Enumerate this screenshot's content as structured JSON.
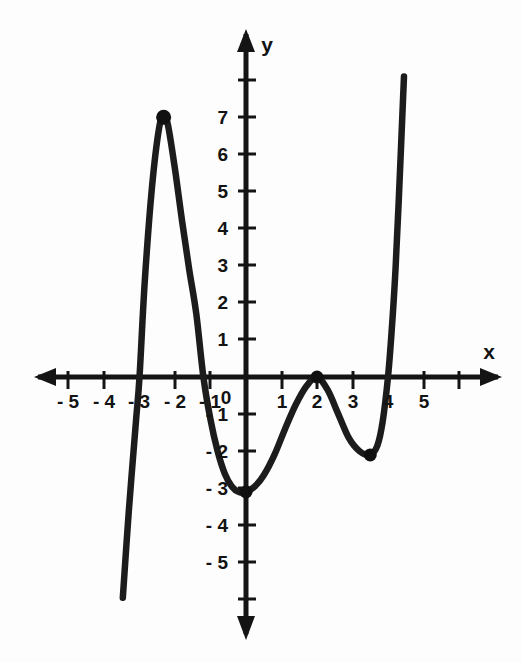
{
  "figure": {
    "title": "",
    "background_color": "#fdfdfd",
    "ink_color": "#141414"
  },
  "axes": {
    "x_axis_label": "x",
    "y_axis_label": "y",
    "origin_label": "0",
    "x_tick_labels": [
      "- 5",
      "- 4",
      "- 3",
      "- 2",
      "- 1",
      "1",
      "2",
      "3",
      "4",
      "5",
      "6"
    ],
    "y_tick_labels": [
      "7",
      "6",
      "5",
      "4",
      "3",
      "2",
      "1",
      "- 1",
      "- 2",
      "- 3",
      "- 4",
      "- 5"
    ]
  },
  "chart_data": {
    "type": "line",
    "title": "",
    "xlabel": "x",
    "ylabel": "y",
    "grid": false,
    "legend": null,
    "xlim": [
      -5.7,
      7.2
    ],
    "ylim": [
      -7.0,
      9.4
    ],
    "xticks": [
      -5,
      -4,
      -3,
      -2,
      -1,
      0,
      1,
      2,
      3,
      4,
      5,
      6
    ],
    "yticks": [
      -6,
      -5,
      -4,
      -3,
      -2,
      -1,
      0,
      1,
      2,
      3,
      4,
      5,
      6,
      7,
      8
    ],
    "xtick_labels_shown": [
      -5,
      -4,
      -3,
      -2,
      -1,
      1,
      2,
      3,
      4,
      5
    ],
    "ytick_labels_shown": [
      7,
      6,
      5,
      4,
      3,
      2,
      1,
      -1,
      -2,
      -3,
      -4,
      -5
    ],
    "series": [
      {
        "name": "polynomial curve",
        "x": [
          -3.47,
          -3.3,
          -3.1,
          -3.0,
          -2.85,
          -2.65,
          -2.45,
          -2.32,
          -2.2,
          -2.0,
          -1.8,
          -1.6,
          -1.4,
          -1.2,
          -1.0,
          -0.8,
          -0.6,
          -0.4,
          -0.2,
          0.0,
          0.25,
          0.5,
          0.8,
          1.1,
          1.4,
          1.7,
          2.0,
          2.3,
          2.6,
          2.9,
          3.2,
          3.5,
          3.7,
          3.85,
          4.0,
          4.1,
          4.2,
          4.3,
          4.45
        ],
        "y": [
          -5.95,
          -3.6,
          -1.2,
          0.0,
          2.6,
          5.1,
          6.7,
          7.0,
          6.8,
          5.6,
          4.2,
          2.9,
          1.7,
          0.0,
          -1.15,
          -2.0,
          -2.6,
          -2.95,
          -3.1,
          -3.1,
          -2.95,
          -2.65,
          -2.1,
          -1.4,
          -0.75,
          -0.25,
          0.0,
          -0.35,
          -1.0,
          -1.65,
          -2.0,
          -2.1,
          -1.85,
          -1.2,
          0.0,
          1.2,
          2.7,
          4.7,
          8.1
        ]
      }
    ],
    "marked_points": [
      {
        "label": "local maximum",
        "x": -2.32,
        "y": 7.0
      },
      {
        "label": "local minimum",
        "x": 0.0,
        "y": -3.1
      },
      {
        "label": "local maximum on x-axis",
        "x": 2.0,
        "y": 0.0
      },
      {
        "label": "local minimum",
        "x": 3.5,
        "y": -2.1
      }
    ],
    "x_intercepts": [
      -3.0,
      -1.2,
      2.0,
      4.0
    ],
    "y_intercept": -3.1
  }
}
